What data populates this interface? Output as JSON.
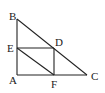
{
  "diagram": {
    "type": "geometry",
    "points": {
      "A": {
        "x": 17,
        "y": 75,
        "label": "A",
        "lx": 9,
        "ly": 84
      },
      "B": {
        "x": 17,
        "y": 19,
        "label": "B",
        "lx": 9,
        "ly": 20
      },
      "C": {
        "x": 87,
        "y": 75,
        "label": "C",
        "lx": 91,
        "ly": 80
      },
      "D": {
        "x": 54,
        "y": 48,
        "label": "D",
        "lx": 55,
        "ly": 46
      },
      "E": {
        "x": 17,
        "y": 48,
        "label": "E",
        "lx": 7,
        "ly": 52
      },
      "F": {
        "x": 54,
        "y": 75,
        "label": "F",
        "lx": 51,
        "ly": 88
      }
    },
    "segments": [
      [
        "B",
        "A"
      ],
      [
        "A",
        "C"
      ],
      [
        "B",
        "C"
      ],
      [
        "E",
        "D"
      ],
      [
        "D",
        "F"
      ],
      [
        "E",
        "F"
      ]
    ],
    "stroke_color": "#222222",
    "background": "#ffffff"
  }
}
